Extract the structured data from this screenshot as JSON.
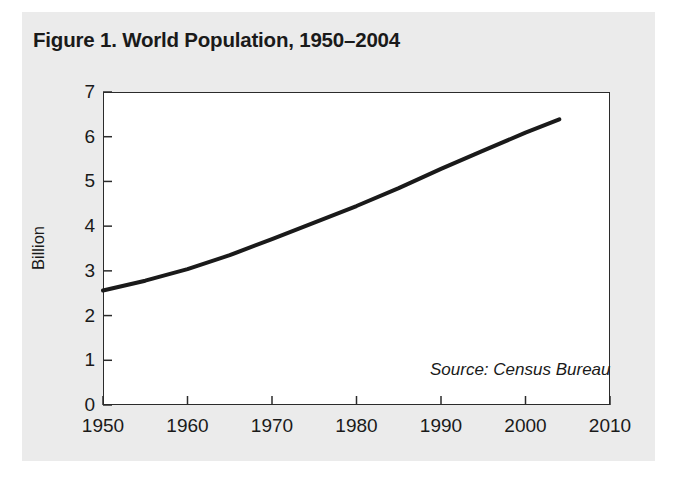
{
  "figure": {
    "title": "Figure 1. World Population, 1950–2004",
    "source_note": "Source: Census Bureau",
    "panel_color": "#ebebeb",
    "line_color": "#1a1a1a",
    "axis_color": "#2b2b2b"
  },
  "chart_data": {
    "type": "line",
    "title": "Figure 1. World Population, 1950–2004",
    "xlabel": "",
    "ylabel": "Billion",
    "xlim": [
      1950,
      2010
    ],
    "ylim": [
      0,
      7
    ],
    "xticks": [
      1950,
      1960,
      1970,
      1980,
      1990,
      2000,
      2010
    ],
    "yticks": [
      0,
      1,
      2,
      3,
      4,
      5,
      6,
      7
    ],
    "xtick_labels": [
      "1950",
      "1960",
      "1970",
      "1980",
      "1990",
      "2000",
      "2010"
    ],
    "ytick_labels": [
      "0",
      "1",
      "2",
      "3",
      "4",
      "5",
      "6",
      "7"
    ],
    "grid": false,
    "legend": false,
    "annotations": [
      "Source: Census Bureau"
    ],
    "series": [
      {
        "name": "World Population",
        "units": "Billion",
        "x": [
          1950,
          1955,
          1960,
          1965,
          1970,
          1975,
          1980,
          1985,
          1990,
          1995,
          2000,
          2004
        ],
        "values": [
          2.56,
          2.78,
          3.04,
          3.35,
          3.71,
          4.08,
          4.45,
          4.85,
          5.28,
          5.69,
          6.09,
          6.39
        ]
      }
    ]
  }
}
